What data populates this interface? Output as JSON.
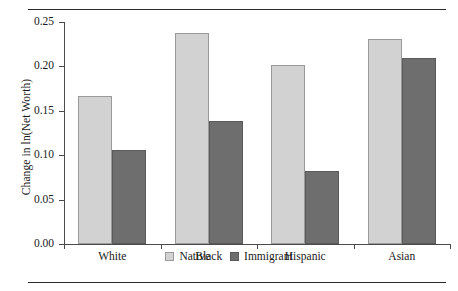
{
  "chart_data": {
    "type": "bar",
    "title": "",
    "xlabel": "",
    "ylabel": "Change in ln(Net Worth)",
    "categories": [
      "White",
      "Black",
      "Hispanic",
      "Asian"
    ],
    "series": [
      {
        "name": "Native",
        "color": "#d2d2d2",
        "values": [
          0.167,
          0.238,
          0.202,
          0.231
        ]
      },
      {
        "name": "Immigrant",
        "color": "#6e6e6e",
        "values": [
          0.106,
          0.139,
          0.082,
          0.209
        ]
      }
    ],
    "ylim": [
      0.0,
      0.25
    ],
    "ytick_labels": [
      "0.00",
      "0.05",
      "0.10",
      "0.15",
      "0.20",
      "0.25"
    ],
    "ytick_values": [
      0.0,
      0.05,
      0.1,
      0.15,
      0.2,
      0.25
    ],
    "grid": false,
    "legend_position": "bottom-center",
    "frame": "left-bottom-only",
    "rules": [
      "top-horizontal-rule",
      "bottom-horizontal-rule"
    ]
  }
}
